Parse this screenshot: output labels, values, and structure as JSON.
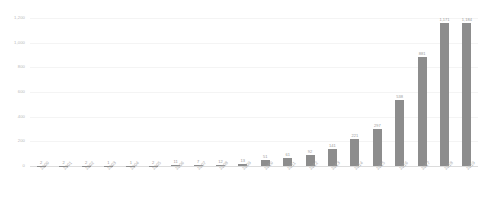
{
  "chart_data": {
    "type": "bar",
    "title": "",
    "xlabel": "",
    "ylabel": "",
    "ylim": [
      0,
      1200
    ],
    "grid": true,
    "legend": "none",
    "orientation": "vertical",
    "bar_color": "#8d8d8d",
    "label_color": "#9a9a9a",
    "axis_color": "#b9b9b9",
    "gridline_color": "#f4f4f4",
    "background": "#ffffff",
    "yticks": [
      "0",
      "200",
      "400",
      "600",
      "800",
      "1,000",
      "1,200"
    ],
    "ytick_values": [
      0,
      200,
      400,
      600,
      800,
      1000,
      1200
    ],
    "categories": [
      "2000",
      "2001",
      "2002",
      "2003",
      "2004",
      "2005",
      "2006",
      "2007",
      "2008",
      "2009",
      "2010",
      "2011",
      "2012",
      "2013",
      "2014",
      "2015",
      "2016",
      "2017",
      "2018",
      "2019"
    ],
    "values": [
      2,
      2,
      2,
      1,
      1,
      2,
      11,
      7,
      12,
      13,
      51,
      61,
      92,
      141,
      221,
      297,
      538,
      881,
      1171,
      1184
    ],
    "value_labels": [
      "2",
      "2",
      "2",
      "1",
      "1",
      "2",
      "11",
      "7",
      "12",
      "13",
      "51",
      "61",
      "92",
      "141",
      "221",
      "297",
      "538",
      "881",
      "1,171",
      "1,184"
    ]
  }
}
